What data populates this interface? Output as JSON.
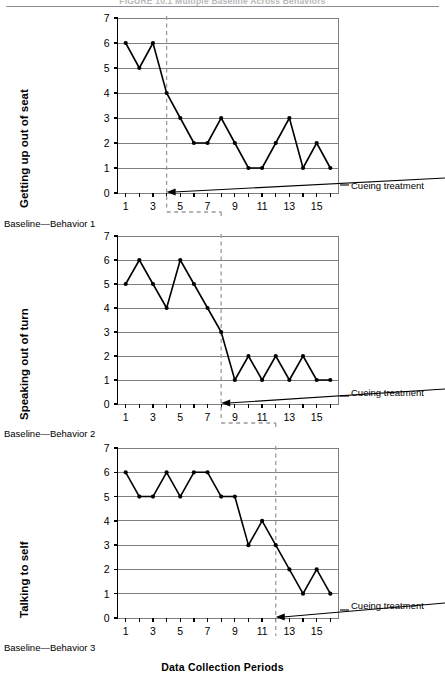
{
  "figure": {
    "title": "FIGURE 10.1  Multiple Baseline Across Behaviors",
    "xaxis_title": "Data Collection Periods"
  },
  "chart_data": [
    {
      "type": "line",
      "title": "Getting up out of seat",
      "ylabel": "Getting up out of seat",
      "xlabel": "Data Collection Periods",
      "baseline_label": "Baseline—Behavior 1",
      "annotation": "Cueing treatment",
      "intervention_x": 4,
      "x": [
        1,
        2,
        3,
        4,
        5,
        6,
        7,
        8,
        9,
        10,
        11,
        12,
        13,
        14,
        15,
        16
      ],
      "values": [
        6,
        5,
        6,
        4,
        3,
        2,
        2,
        3,
        2,
        1,
        1,
        2,
        3,
        1,
        2,
        1
      ],
      "xlim": [
        0.4,
        16.6
      ],
      "ylim": [
        0,
        7
      ],
      "yticks": [
        0,
        1,
        2,
        3,
        4,
        5,
        6,
        7
      ],
      "xticks": [
        1,
        3,
        5,
        7,
        9,
        11,
        13,
        15
      ],
      "grid": true,
      "legend": "none"
    },
    {
      "type": "line",
      "title": "Speaking out of turn",
      "ylabel": "Speaking out of turn",
      "xlabel": "Data Collection Periods",
      "baseline_label": "Baseline—Behavior 2",
      "annotation": "Cueing treatment",
      "intervention_x": 8,
      "x": [
        1,
        2,
        3,
        4,
        5,
        6,
        7,
        8,
        9,
        10,
        11,
        12,
        13,
        14,
        15,
        16
      ],
      "values": [
        5,
        6,
        5,
        4,
        6,
        5,
        4,
        3,
        1,
        2,
        1,
        2,
        1,
        2,
        1,
        1
      ],
      "xlim": [
        0.4,
        16.6
      ],
      "ylim": [
        0,
        7
      ],
      "yticks": [
        0,
        1,
        2,
        3,
        4,
        5,
        6,
        7
      ],
      "xticks": [
        1,
        3,
        5,
        7,
        9,
        11,
        13,
        15
      ],
      "grid": true,
      "legend": "none"
    },
    {
      "type": "line",
      "title": "Talking to self",
      "ylabel": "Talking to self",
      "xlabel": "Data Collection Periods",
      "baseline_label": "Baseline—Behavior 3",
      "annotation": "Cueing treatment",
      "intervention_x": 12,
      "x": [
        1,
        2,
        3,
        4,
        5,
        6,
        7,
        8,
        9,
        10,
        11,
        12,
        13,
        14,
        15,
        16
      ],
      "values": [
        6,
        5,
        5,
        6,
        5,
        6,
        6,
        5,
        5,
        3,
        4,
        3,
        2,
        1,
        2,
        1
      ],
      "xlim": [
        0.4,
        16.6
      ],
      "ylim": [
        0,
        7
      ],
      "yticks": [
        0,
        1,
        2,
        3,
        4,
        5,
        6,
        7
      ],
      "xticks": [
        1,
        3,
        5,
        7,
        9,
        11,
        13,
        15
      ],
      "grid": true,
      "legend": "none"
    }
  ],
  "colors": {
    "line": "#000000",
    "grid": "#7e7e84",
    "axis": "#000000",
    "dashed": "#9a9aa0",
    "rule": "#8d8d95"
  }
}
